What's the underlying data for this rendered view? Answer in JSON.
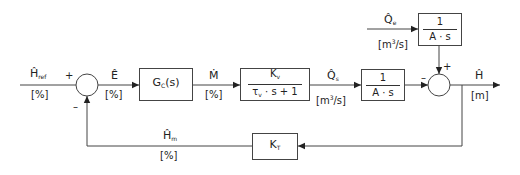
{
  "diagram": {
    "type": "block-diagram",
    "title": "",
    "signals": {
      "h_ref": {
        "symbol": "Ĥ",
        "subscript": "ref",
        "unit": "[%]"
      },
      "e": {
        "symbol": "Ê",
        "subscript": "",
        "unit": "[%]"
      },
      "m": {
        "symbol": "Ṁ",
        "subscript": "",
        "unit": "[%]"
      },
      "q_s": {
        "symbol": "Q̂",
        "subscript": "s",
        "unit_prefix": "[m",
        "unit_sup": "3",
        "unit_suffix": "/s]"
      },
      "q_e": {
        "symbol": "Q̂",
        "subscript": "e",
        "unit_prefix": "[m",
        "unit_sup": "3",
        "unit_suffix": "/s]"
      },
      "h": {
        "symbol": "Ĥ",
        "subscript": "",
        "unit": "[m]"
      },
      "h_m": {
        "symbol": "Ĥ",
        "subscript": "m",
        "unit": "[%]"
      }
    },
    "blocks": {
      "controller": {
        "main": "G",
        "sub": "C",
        "suffix": "(s)"
      },
      "valve": {
        "num_main": "K",
        "num_sub": "v",
        "den_main": "τ",
        "den_sub": "v",
        "den_suffix": "· s + 1"
      },
      "tank_s": {
        "numerator": "1",
        "denominator": "A · s"
      },
      "tank_e": {
        "numerator": "1",
        "denominator": "A · s"
      },
      "transmitter": {
        "main": "K",
        "sub": "T"
      }
    },
    "summing_junctions": {
      "sum1": {
        "plus": "+",
        "minus": "–"
      },
      "sum2": {
        "plus": "+",
        "minus": "–"
      }
    }
  }
}
